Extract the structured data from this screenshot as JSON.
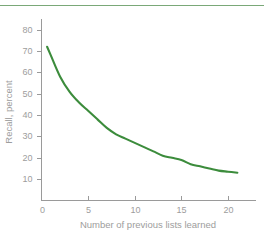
{
  "figure": {
    "background_color": "#ffffff",
    "top_rule_color": "#7aa878",
    "axis_color": "#9a9a9a",
    "label_color": "#9d9d9d"
  },
  "chart_data": {
    "type": "line",
    "title": "",
    "subtitle": "",
    "xlabel": "Number of previous lists learned",
    "ylabel": "Recall, percent",
    "xlim": [
      0,
      23
    ],
    "ylim": [
      0,
      85
    ],
    "grid": false,
    "legend": null,
    "line_color": "#3c8c3c",
    "xticks": [
      0,
      5,
      10,
      15,
      20
    ],
    "xtick_labels": [
      "0",
      "5",
      "10",
      "15",
      "20"
    ],
    "yticks": [
      10,
      20,
      30,
      40,
      50,
      60,
      70,
      80
    ],
    "ytick_labels": [
      "10",
      "20",
      "30",
      "40",
      "50",
      "60",
      "70",
      "80"
    ],
    "series": [
      {
        "name": "Recall",
        "x": [
          0.6,
          1,
          2,
          3,
          4,
          5,
          6,
          7,
          8,
          9,
          10,
          11,
          12,
          13,
          14,
          15,
          16,
          17,
          18,
          19,
          20,
          21
        ],
        "values": [
          72,
          68,
          58,
          51,
          46,
          42,
          38,
          34,
          31,
          29,
          27,
          25,
          23,
          21,
          20,
          19,
          17,
          16,
          15,
          14,
          13.5,
          13
        ]
      }
    ],
    "annotations": []
  }
}
